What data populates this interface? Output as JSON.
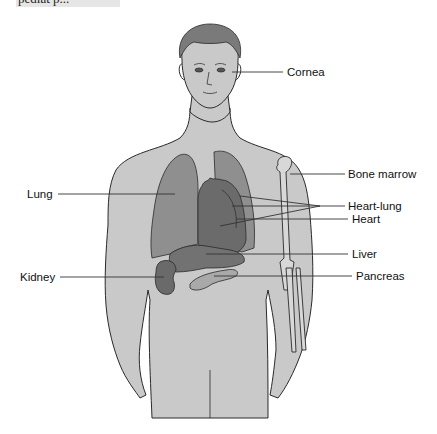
{
  "caption_fragment": "pediat p...",
  "figure": {
    "type": "anatomical-diagram",
    "colors": {
      "skin": "#c9c9c9",
      "hair": "#7a7a7a",
      "lung": "#8f8f8f",
      "heart": "#6b6b6b",
      "liver": "#727272",
      "kidney": "#6a6a6a",
      "pancreas": "#a9a9a9",
      "bone": "#d8d8d8",
      "outline": "#2a2a2a",
      "leader": "#333333"
    }
  },
  "labels": {
    "cornea": "Cornea",
    "bone_marrow": "Bone marrow",
    "lung": "Lung",
    "heart_lung": "Heart-lung",
    "heart": "Heart",
    "liver": "Liver",
    "kidney": "Kidney",
    "pancreas": "Pancreas"
  }
}
